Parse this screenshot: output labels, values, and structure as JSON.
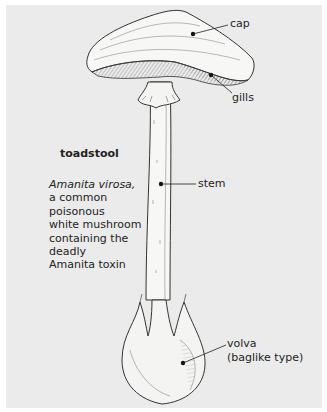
{
  "figure": {
    "title": "toadstool",
    "description": {
      "species": "Amanita virosa,",
      "lines": [
        "a common",
        "poisonous",
        "white mushroom",
        "containing the",
        "deadly",
        "Amanita toxin"
      ]
    },
    "labels": {
      "cap": "cap",
      "gills": "gills",
      "stem": "stem",
      "volva": "volva",
      "volva_type": "(baglike type)"
    },
    "colors": {
      "background": "#ebebeb",
      "ink": "#1e1e1e",
      "mushroom_fill": "#f7f7f5"
    }
  }
}
